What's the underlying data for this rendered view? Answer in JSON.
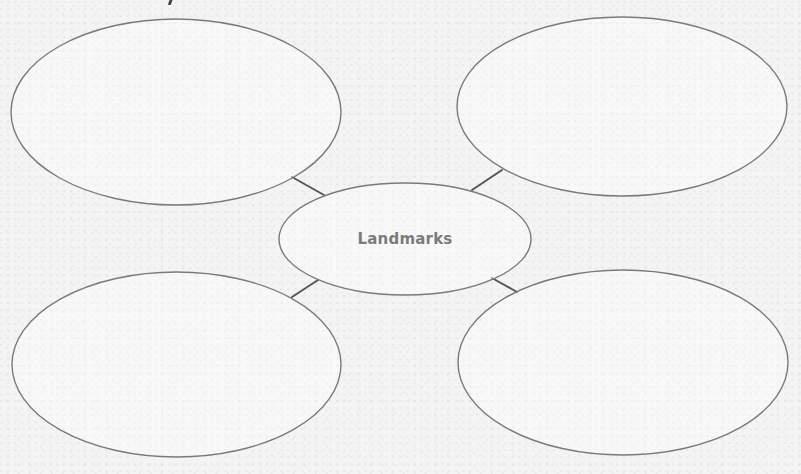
{
  "diagram": {
    "type": "concept-map",
    "center": {
      "label": "Landmarks",
      "text_color": "#7b7b7b"
    },
    "outline_color": "#7a7a7a",
    "connector_color": "#555555",
    "background_color": "#f4f4f4",
    "nodes": [
      {
        "id": "top-left",
        "label": ""
      },
      {
        "id": "top-right",
        "label": ""
      },
      {
        "id": "bottom-left",
        "label": ""
      },
      {
        "id": "bottom-right",
        "label": ""
      }
    ]
  }
}
